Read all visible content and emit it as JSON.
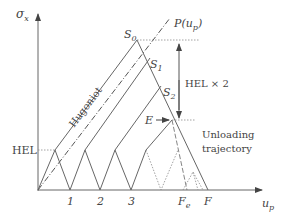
{
  "diagram": {
    "axes": {
      "y_label": "σ",
      "y_label_sub": "x",
      "x_label": "u",
      "x_label_sub": "p"
    },
    "labels": {
      "hugoniot": "Hugoniot",
      "p_curve": "P(u",
      "p_curve_sub": "p",
      "p_curve_close": ")",
      "hel": "HEL",
      "hel_x2": "HEL × 2",
      "s0": "S",
      "s0_sub": "0",
      "s1": "S",
      "s1_sub": "1",
      "s2": "S",
      "s2_sub": "2",
      "e": "E",
      "unloading_line1": "Unloading",
      "unloading_line2": "trajectory",
      "tick1": "1",
      "tick2": "2",
      "tick3": "3",
      "fe": "F",
      "fe_sub": "e",
      "f": "F"
    },
    "colors": {
      "line": "#6a6a6a",
      "text": "#444444",
      "dotted": "#8a8a8a"
    }
  }
}
